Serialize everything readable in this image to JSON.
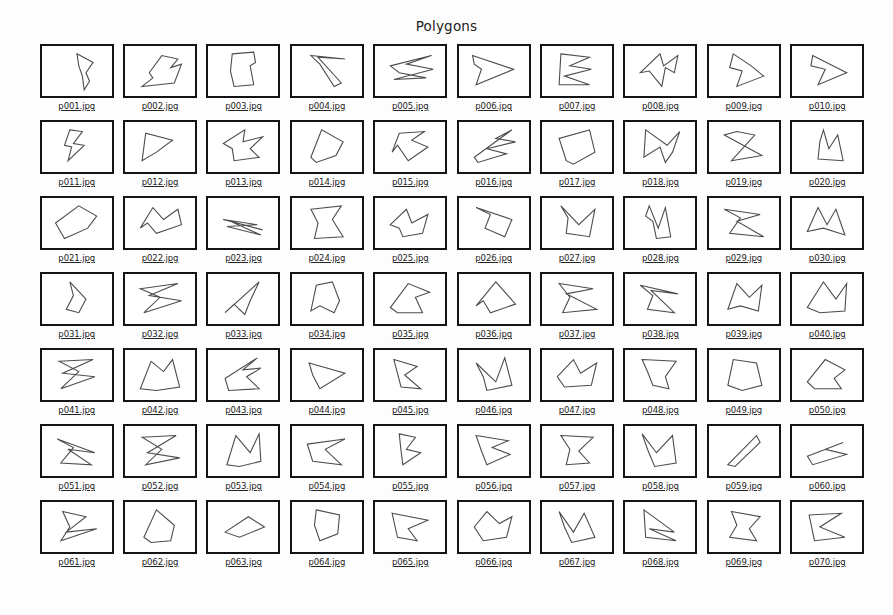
{
  "page": {
    "title": "Polygons",
    "bottom_caption": "",
    "background_color": "#ffffff",
    "frame_border_color": "#141414",
    "polygon_stroke_color": "#4d4d4d",
    "label_color": "#232323"
  },
  "grid": {
    "rows": 7,
    "columns": 10,
    "total_thumbnails": 70
  },
  "thumbnails": [
    {
      "label": "p001.jpg",
      "points": "38,8 56,18 48,30 52,40 46,50 44,34 40,22"
    },
    {
      "label": "p002.jpg",
      "points": "26,30 40,10 58,14 50,24 62,20 54,42 36,44 18,46 30,36"
    },
    {
      "label": "p003.jpg",
      "points": "26,8 50,6 52,18 46,22 50,44 28,46 24,28"
    },
    {
      "label": "p004.jpg",
      "points": "20,10 58,14 28,12 54,42 46,46 30,20"
    },
    {
      "label": "p005.jpg",
      "points": "16,22 62,10 34,20 64,26 20,38 56,36 26,30"
    },
    {
      "label": "p006.jpg",
      "points": "14,10 60,26 18,44 24,26 16,20"
    },
    {
      "label": "p007.jpg",
      "points": "20,8 52,12 30,22 54,26 24,34 52,44 18,44"
    },
    {
      "label": "p008.jpg",
      "points": "16,30 38,8 42,22 58,10 54,30 44,24 40,46 26,28"
    },
    {
      "label": "p009.jpg",
      "points": "26,8 46,22 60,34 30,46 36,28 22,24"
    },
    {
      "label": "p010.jpg",
      "points": "22,10 60,30 28,44 36,26 20,22"
    },
    {
      "label": "p011.jpg",
      "points": "30,8 44,10 34,24 46,26 28,44 32,28 24,26"
    },
    {
      "label": "p012.jpg",
      "points": "18,44 22,12 52,20 34,34"
    },
    {
      "label": "p013.jpg",
      "points": "16,24 40,8 38,22 60,16 46,30 56,40 28,44 26,30"
    },
    {
      "label": "p014.jpg",
      "points": "20,40 32,8 56,22 48,38 26,46"
    },
    {
      "label": "p015.jpg",
      "points": "18,34 26,12 54,10 40,20 58,28 36,44 24,26"
    },
    {
      "label": "p016.jpg",
      "points": "16,40 58,8 40,18 62,22 30,30 52,36 20,46"
    },
    {
      "label": "p017.jpg",
      "points": "26,44 18,18 52,8 58,34 34,48"
    },
    {
      "label": "p018.jpg",
      "points": "22,8 46,26 60,10 52,34 44,46 38,28 20,40"
    },
    {
      "label": "p019.jpg",
      "points": "16,14 58,38 24,44 50,14 30,10"
    },
    {
      "label": "p020.jpg",
      "points": "34,8 40,30 50,14 56,44 28,42 30,22"
    },
    {
      "label": "p021.jpg",
      "points": "14,28 40,8 60,20 50,34 24,46"
    },
    {
      "label": "p022.jpg",
      "points": "16,34 30,10 42,24 58,12 62,30 34,40 24,28"
    },
    {
      "label": "p023.jpg",
      "points": "16,24 60,36 24,26 58,42 20,32 54,30"
    },
    {
      "label": "p024.jpg",
      "points": "20,12 54,8 44,24 56,44 24,46 28,28"
    },
    {
      "label": "p025.jpg",
      "points": "16,30 34,12 40,28 58,18 52,40 30,44 26,34"
    },
    {
      "label": "p026.jpg",
      "points": "18,10 58,24 50,44 28,34 34,18"
    },
    {
      "label": "p027.jpg",
      "points": "20,8 40,30 58,12 52,44 26,40 28,22"
    },
    {
      "label": "p028.jpg",
      "points": "26,8 36,34 44,10 50,44 34,46 30,26 22,20"
    },
    {
      "label": "p029.jpg",
      "points": "16,12 56,18 30,26 60,44 22,40 34,22"
    },
    {
      "label": "p030.jpg",
      "points": "16,38 28,10 38,30 48,12 58,42 34,34"
    },
    {
      "label": "p031.jpg",
      "points": "30,8 48,28 40,44 26,40 34,24"
    },
    {
      "label": "p032.jpg",
      "points": "16,16 58,10 26,24 62,30 20,44 38,26"
    },
    {
      "label": "p033.jpg",
      "points": "18,44 56,8 46,30 40,46 28,34"
    },
    {
      "label": "p034.jpg",
      "points": "20,42 26,12 44,8 52,30 46,44 30,36"
    },
    {
      "label": "p035.jpg",
      "points": "16,38 36,10 60,20 44,26 52,44 24,44"
    },
    {
      "label": "p036.jpg",
      "points": "18,36 40,8 62,34 34,44 26,30"
    },
    {
      "label": "p037.jpg",
      "points": "18,10 56,16 26,22 60,40 22,44 30,26"
    },
    {
      "label": "p038.jpg",
      "points": "16,12 58,22 28,18 54,44 24,40 30,24"
    },
    {
      "label": "p039.jpg",
      "points": "20,40 30,10 44,26 58,12 54,42 34,36"
    },
    {
      "label": "p040.jpg",
      "points": "16,38 34,8 48,28 60,10 58,42 30,44"
    },
    {
      "label": "p041.jpg",
      "points": "18,12 56,10 22,26 58,30 20,44 40,24"
    },
    {
      "label": "p042.jpg",
      "points": "16,44 28,12 42,24 52,10 60,42 34,46"
    },
    {
      "label": "p043.jpg",
      "points": "18,32 54,8 38,22 58,20 42,30 56,44 22,46"
    },
    {
      "label": "p044.jpg",
      "points": "18,14 58,26 30,44 22,28"
    },
    {
      "label": "p045.jpg",
      "points": "20,10 46,18 32,28 50,44 28,42 24,26"
    },
    {
      "label": "p046.jpg",
      "points": "18,14 40,36 50,8 58,40 30,46 26,30"
    },
    {
      "label": "p047.jpg",
      "points": "16,30 34,10 42,26 60,14 54,40 24,42"
    },
    {
      "label": "p048.jpg",
      "points": "18,10 56,12 44,30 48,44 30,40 24,24"
    },
    {
      "label": "p049.jpg",
      "points": "20,40 26,10 52,14 58,40 36,46"
    },
    {
      "label": "p050.jpg",
      "points": "16,36 36,10 58,22 46,32 54,44 24,44"
    },
    {
      "label": "p051.jpg",
      "points": "16,14 58,30 28,26 54,44 20,42 34,24"
    },
    {
      "label": "p052.jpg",
      "points": "18,12 56,10 24,30 60,36 22,44 40,26"
    },
    {
      "label": "p053.jpg",
      "points": "20,44 30,10 46,30 56,8 58,40 34,46"
    },
    {
      "label": "p054.jpg",
      "points": "16,20 58,14 36,26 54,44 22,40"
    },
    {
      "label": "p055.jpg",
      "points": "26,8 44,12 34,26 50,30 30,44 28,28"
    },
    {
      "label": "p056.jpg",
      "points": "18,10 54,16 36,24 56,32 30,44 24,28"
    },
    {
      "label": "p057.jpg",
      "points": "20,10 56,12 40,28 52,42 26,44 30,26"
    },
    {
      "label": "p058.jpg",
      "points": "18,8 34,30 52,10 56,42 32,46 24,26"
    },
    {
      "label": "p059.jpg",
      "points": "20,44 52,10 56,18 28,46"
    },
    {
      "label": "p060.jpg",
      "points": "16,34 56,18 36,26 60,32 22,44"
    },
    {
      "label": "p061.jpg",
      "points": "22,10 48,16 26,34 60,30 20,44 30,28"
    },
    {
      "label": "p062.jpg",
      "points": "20,40 34,8 54,26 50,44 28,46"
    },
    {
      "label": "p063.jpg",
      "points": "18,34 44,16 62,28 34,40"
    },
    {
      "label": "p064.jpg",
      "points": "26,8 52,14 50,36 30,44 24,26"
    },
    {
      "label": "p065.jpg",
      "points": "18,12 58,20 36,30 46,44 24,40"
    },
    {
      "label": "p066.jpg",
      "points": "16,28 30,10 44,24 58,16 52,40 26,44"
    },
    {
      "label": "p067.jpg",
      "points": "18,10 34,34 46,12 58,40 32,46 24,28"
    },
    {
      "label": "p068.jpg",
      "points": "20,8 54,34 26,30 56,44 22,40"
    },
    {
      "label": "p069.jpg",
      "points": "24,10 56,16 44,30 52,44 22,40 30,26"
    },
    {
      "label": "p070.jpg",
      "points": "18,14 54,12 30,28 58,40 24,44"
    }
  ]
}
